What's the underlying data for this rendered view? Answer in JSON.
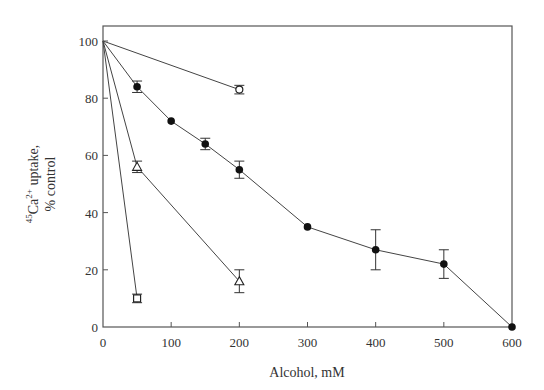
{
  "chart_data": {
    "type": "line",
    "title": "",
    "xlabel": "Alcohol, mM",
    "ylabel": "45Ca2+ uptake, % control",
    "xlim": [
      0,
      600
    ],
    "ylim": [
      0,
      100
    ],
    "xticks": [
      0,
      100,
      200,
      300,
      400,
      500,
      600
    ],
    "yticks": [
      0,
      20,
      40,
      60,
      80,
      100
    ],
    "grid": false,
    "legend": null,
    "series": [
      {
        "name": "open-circle",
        "marker": "open-circle",
        "x": [
          0,
          200
        ],
        "y": [
          100,
          83
        ],
        "err": [
          0,
          1.5
        ]
      },
      {
        "name": "filled-circle",
        "marker": "filled-circle",
        "x": [
          0,
          50,
          100,
          150,
          200,
          300,
          400,
          500,
          600
        ],
        "y": [
          100,
          84,
          72,
          64,
          55,
          35,
          27,
          22,
          0
        ],
        "err": [
          0,
          2,
          0,
          2,
          3,
          0,
          7,
          5,
          0
        ]
      },
      {
        "name": "open-triangle",
        "marker": "open-triangle",
        "x": [
          0,
          50,
          200
        ],
        "y": [
          100,
          56,
          16
        ],
        "err": [
          0,
          2,
          4
        ]
      },
      {
        "name": "open-square",
        "marker": "open-square",
        "x": [
          0,
          50
        ],
        "y": [
          100,
          10
        ],
        "err": [
          0,
          1.5
        ]
      }
    ]
  },
  "labels": {
    "xlabel": "Alcohol, mM",
    "ylabel_line1": "45Ca2+ uptake,",
    "ylabel_line2": "% control"
  }
}
